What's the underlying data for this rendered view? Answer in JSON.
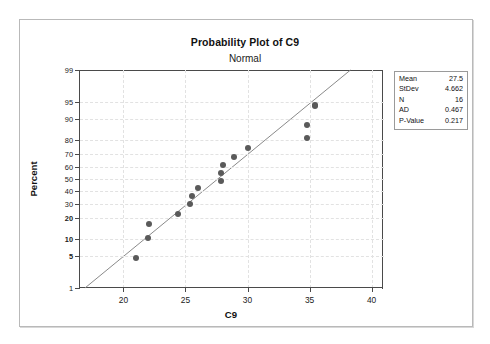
{
  "window": {
    "frame": true
  },
  "title": "Probability Plot of C9",
  "subtitle": "Normal",
  "axes": {
    "x_title": "C9",
    "y_title": "Percent"
  },
  "stats": {
    "rows": [
      {
        "key": "Mean",
        "value": "27.5"
      },
      {
        "key": "StDev",
        "value": "4.662"
      },
      {
        "key": "N",
        "value": "16"
      },
      {
        "key": "AD",
        "value": "0.467"
      },
      {
        "key": "P-Value",
        "value": "0.217"
      }
    ]
  },
  "colors": {
    "point": "#5a5a5a",
    "fit_line": "#8a8a8a",
    "axis": "#4a4a4a",
    "grid": "#e2e2e2",
    "frame": "#b9b9b9"
  },
  "chart_data": {
    "type": "scatter",
    "title": "Probability Plot of C9",
    "subtitle": "Normal",
    "xlabel": "C9",
    "ylabel": "Percent",
    "distribution": "Normal",
    "xlim": [
      16.5,
      41.0
    ],
    "ylim_percent": [
      1,
      99
    ],
    "y_scale": "normal-probability",
    "grid": true,
    "legend": "none",
    "xticks": [
      20,
      25,
      30,
      35,
      40
    ],
    "yticks": [
      1,
      5,
      10,
      20,
      30,
      40,
      50,
      60,
      70,
      80,
      90,
      95,
      99
    ],
    "ytick_bold": [
      20,
      10,
      5
    ],
    "n_points": 16,
    "points": [
      {
        "x": 21.0,
        "percent": 4.5
      },
      {
        "x": 22.0,
        "percent": 10.5
      },
      {
        "x": 22.1,
        "percent": 17.0
      },
      {
        "x": 24.4,
        "percent": 23.0
      },
      {
        "x": 25.4,
        "percent": 29.5
      },
      {
        "x": 25.5,
        "percent": 36.0
      },
      {
        "x": 26.0,
        "percent": 42.5
      },
      {
        "x": 27.9,
        "percent": 48.5
      },
      {
        "x": 27.9,
        "percent": 55.0
      },
      {
        "x": 28.0,
        "percent": 61.5
      },
      {
        "x": 28.9,
        "percent": 68.0
      },
      {
        "x": 30.0,
        "percent": 74.5
      },
      {
        "x": 34.8,
        "percent": 81.0
      },
      {
        "x": 34.8,
        "percent": 87.5
      },
      {
        "x": 35.4,
        "percent": 94.0
      },
      {
        "x": 35.4,
        "percent": 94.2
      }
    ],
    "fit_line": {
      "description": "Normal distribution fit line through mean 27.5, stdev 4.662",
      "x_start": 16.9,
      "percent_start": 1.0,
      "x_end": 38.3,
      "percent_end": 99.0
    },
    "annotations": {
      "stats_box": {
        "Mean": 27.5,
        "StDev": 4.662,
        "N": 16,
        "AD": 0.467,
        "P-Value": 0.217
      }
    }
  }
}
